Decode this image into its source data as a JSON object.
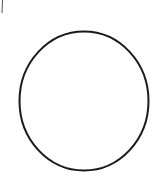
{
  "canvas": {
    "width": 161,
    "height": 179,
    "background": "#ffffff"
  },
  "shapes": {
    "circle": {
      "cx": 84,
      "cy": 101,
      "rx": 64.5,
      "ry": 69.5,
      "stroke": "#1a1a1a",
      "stroke_width": 2,
      "fill": "none"
    },
    "corner_stroke": {
      "x1": 2.5,
      "y1": 0,
      "x2": 2,
      "y2": 13,
      "stroke": "#555555",
      "stroke_width": 1
    }
  }
}
